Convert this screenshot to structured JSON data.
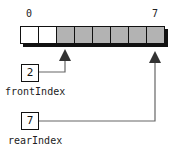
{
  "diagram": {
    "type": "circular-queue-array",
    "array": {
      "index_labels": {
        "first": "0",
        "last": "7"
      },
      "cells": [
        {
          "index": 0,
          "state": "empty"
        },
        {
          "index": 1,
          "state": "empty"
        },
        {
          "index": 2,
          "state": "filled"
        },
        {
          "index": 3,
          "state": "filled"
        },
        {
          "index": 4,
          "state": "filled"
        },
        {
          "index": 5,
          "state": "filled"
        },
        {
          "index": 6,
          "state": "filled"
        },
        {
          "index": 7,
          "state": "filled"
        }
      ],
      "colors": {
        "empty": "#ffffff",
        "filled": "#b3b3b3",
        "border": "#111111"
      }
    },
    "front": {
      "name": "frontIndex",
      "value": "2",
      "points_to_index": 2
    },
    "rear": {
      "name": "rearIndex",
      "value": "7",
      "points_to_index": 7
    }
  }
}
